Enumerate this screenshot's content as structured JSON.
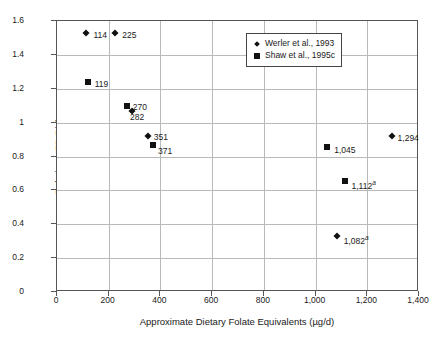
{
  "chart_data": {
    "type": "scatter",
    "title": "",
    "xlabel": "Approximate Dietary Folate Equivalents (µg/d)",
    "ylabel": "Relative NTD Risk",
    "xlim": [
      0,
      1400
    ],
    "ylim": [
      0,
      1.6
    ],
    "xticks": [
      "0",
      "200",
      "400",
      "600",
      "800",
      "1,000",
      "1,200",
      "1,400"
    ],
    "xtick_values": [
      0,
      200,
      400,
      600,
      800,
      1000,
      1200,
      1400
    ],
    "yticks": [
      "0",
      "0.2",
      "0.4",
      "0.6",
      "0.8",
      "1",
      "1.2",
      "1.4",
      "1.6"
    ],
    "ytick_values": [
      0,
      0.2,
      0.4,
      0.6,
      0.8,
      1.0,
      1.2,
      1.4,
      1.6
    ],
    "grid": true,
    "legend_position": "top-right",
    "legend": [
      {
        "label": "Werler et al., 1993",
        "marker": "diamond"
      },
      {
        "label": "Shaw et al., 1995c",
        "marker": "square"
      }
    ],
    "series": [
      {
        "name": "Werler et al., 1993",
        "marker": "diamond",
        "points": [
          {
            "label": "114",
            "x": 114,
            "y": 1.53,
            "sup": "",
            "lx": 7,
            "ly": 2
          },
          {
            "label": "225",
            "x": 225,
            "y": 1.53,
            "sup": "",
            "lx": 7,
            "ly": 2
          },
          {
            "label": "282",
            "x": 290,
            "y": 1.07,
            "sup": "",
            "lx": -2,
            "ly": 6
          },
          {
            "label": "351",
            "x": 351,
            "y": 0.92,
            "sup": "",
            "lx": 6,
            "ly": 1
          },
          {
            "label": "1,082",
            "x": 1082,
            "y": 0.33,
            "sup": "a",
            "lx": 7,
            "ly": 3
          },
          {
            "label": "1,294",
            "x": 1294,
            "y": 0.92,
            "sup": "",
            "lx": 6,
            "ly": 2
          }
        ]
      },
      {
        "name": "Shaw et al., 1995c",
        "marker": "square",
        "points": [
          {
            "label": "119",
            "x": 119,
            "y": 1.24,
            "sup": "",
            "lx": 7,
            "ly": 2
          },
          {
            "label": "270",
            "x": 270,
            "y": 1.1,
            "sup": "",
            "lx": 6,
            "ly": 1
          },
          {
            "label": "371",
            "x": 371,
            "y": 0.87,
            "sup": "",
            "lx": 5,
            "ly": 6
          },
          {
            "label": "1,045",
            "x": 1045,
            "y": 0.855,
            "sup": "",
            "lx": 7,
            "ly": 3
          },
          {
            "label": "1,112",
            "x": 1112,
            "y": 0.655,
            "sup": "a",
            "lx": 7,
            "ly": 3
          }
        ]
      }
    ]
  }
}
